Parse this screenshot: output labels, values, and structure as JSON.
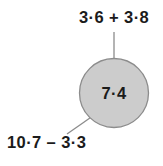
{
  "diagram": {
    "background_color": "#ffffff",
    "node": {
      "value": "7·4",
      "fill_color": "#cccccc",
      "stroke_color": "#8c8c8c",
      "center_x": 114,
      "center_y": 93,
      "radius": 35
    },
    "labels": {
      "top_expression": "3·6 + 3·8",
      "bottom_expression": "10·7 – 3·3"
    },
    "connectors": [
      {
        "name": "top-connector",
        "from_x": 114,
        "from_y": 32,
        "to_x": 114,
        "to_y": 58,
        "color": "#8c8c8c"
      },
      {
        "name": "bottom-left-connector",
        "from_x": 93,
        "from_y": 116,
        "to_x": 67,
        "to_y": 134,
        "color": "#8c8c8c"
      }
    ]
  }
}
